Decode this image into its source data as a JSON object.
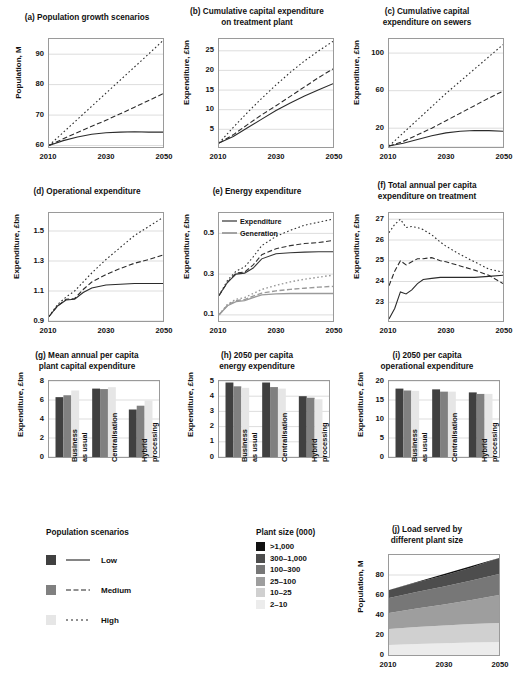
{
  "colors": {
    "low": "#404040",
    "medium": "#808080",
    "high": "#e6e6e6",
    "expenditure": "#333333",
    "generation": "#9a9a9a",
    "axis": "#9a9a9a",
    "grid": "#d9d9d9",
    "plant_sizes": [
      "#111111",
      "#4d4d4d",
      "#777777",
      "#9e9e9e",
      "#d0d0d0",
      "#ececec"
    ]
  },
  "panels": {
    "a": {
      "title": "(a) Population growth scenarios",
      "ylabel": "Population, M",
      "xlabel": "",
      "yticks": [
        "60",
        "70",
        "80",
        "90"
      ],
      "xticks": [
        "2010",
        "2030",
        "2050"
      ]
    },
    "b": {
      "title": "(b) Cumulative capital expenditure\non treatment plant",
      "title_line1": "(b) Cumulative capital expenditure",
      "title_line2": "on treatment plant",
      "ylabel": "Expenditure, £bn",
      "yticks": [
        "5",
        "10",
        "15",
        "20",
        "25"
      ],
      "xticks": [
        "2010",
        "2030",
        "2050"
      ]
    },
    "c": {
      "title_line1": "(c) Cumulative capital",
      "title_line2": "expenditure on sewers",
      "ylabel": "Expenditure, £bn",
      "yticks": [
        "0",
        "20",
        "60",
        "100"
      ],
      "xticks": [
        "2010",
        "2030",
        "2050"
      ]
    },
    "d": {
      "title_line1": "(d) Operational expenditure",
      "title_line2": "",
      "ylabel": "Expenditure, £bn",
      "yticks": [
        "0.9",
        "1.1",
        "1.3",
        "1.5"
      ],
      "xticks": [
        "2010",
        "2030",
        "2050"
      ]
    },
    "e": {
      "title_line1": "(e) Energy expenditure",
      "title_line2": "",
      "ylabel": "Expenditure, £bn",
      "yticks": [
        "0.1",
        "0.3",
        "0.5"
      ],
      "xticks": [
        "2010",
        "2030",
        "2050"
      ],
      "legend": [
        {
          "label": "Expenditure",
          "color": "#333333"
        },
        {
          "label": "Generation",
          "color": "#9a9a9a"
        }
      ]
    },
    "f": {
      "title_line1": "(f) Total annual per capita",
      "title_line2": "expenditure on treatment",
      "ylabel": "Expenditure, £bn",
      "yticks": [
        "23",
        "24",
        "25",
        "26",
        "27"
      ],
      "xticks": [
        "2010",
        "2030",
        "2050"
      ]
    },
    "g": {
      "title_line1": "(g) Mean annual per capita",
      "title_line2": "plant capital expenditure",
      "ylabel": "Expenditure, £bn",
      "yticks": [
        "0",
        "2",
        "4",
        "6",
        "8"
      ],
      "xticks": [
        "Business\nas usual",
        "Centralisation",
        "Hybrid\nprocessing"
      ]
    },
    "h": {
      "title_line1": "(h) 2050 per capita",
      "title_line2": "energy expenditure",
      "ylabel": "Expenditure, £bn",
      "yticks": [
        "0",
        "1",
        "2",
        "3",
        "4",
        "5"
      ],
      "xticks": [
        "Business\nas usual",
        "Centralisation",
        "Hybrid\nprocessing"
      ]
    },
    "i": {
      "title_line1": "(i) 2050 per capita",
      "title_line2": "operational expenditure",
      "ylabel": "Expenditure, £bn",
      "yticks": [
        "0",
        "5",
        "10",
        "15",
        "20"
      ],
      "xticks": [
        "Business\nas usual",
        "Centralisation",
        "Hybrid\nprocessing"
      ]
    },
    "j": {
      "title_line1": "(j) Load served by",
      "title_line2": "different plant size",
      "ylabel": "Population, M",
      "yticks": [
        "0",
        "20",
        "40",
        "60",
        "80"
      ],
      "xticks": [
        "2010",
        "2030",
        "2050"
      ]
    }
  },
  "legends": {
    "population": {
      "title": "Population scenarios",
      "items": [
        {
          "label": "Low",
          "color": "#404040",
          "dash": "solid"
        },
        {
          "label": "Medium",
          "color": "#808080",
          "dash": "dashed"
        },
        {
          "label": "High",
          "color": "#e6e6e6",
          "dash": "dotted"
        }
      ]
    },
    "plant_size": {
      "title": "Plant size (000)",
      "items": [
        {
          "label": ">1,000",
          "color": "#111111"
        },
        {
          "label": "300–1,000",
          "color": "#4d4d4d"
        },
        {
          "label": "100–300",
          "color": "#777777"
        },
        {
          "label": "25–100",
          "color": "#9e9e9e"
        },
        {
          "label": "10–25",
          "color": "#d0d0d0"
        },
        {
          "label": "2–10",
          "color": "#ececec"
        }
      ]
    }
  },
  "chart_data": [
    {
      "id": "a",
      "type": "line",
      "title": "(a) Population growth scenarios",
      "xlabel": "",
      "ylabel": "Population, M",
      "xlim": [
        2010,
        2050
      ],
      "ylim": [
        59.5,
        95
      ],
      "yticks": [
        60,
        70,
        80,
        90
      ],
      "xticks": [
        2010,
        2030,
        2050
      ],
      "grid": true,
      "x": [
        2010,
        2015,
        2020,
        2025,
        2030,
        2035,
        2040,
        2045,
        2050
      ],
      "series": [
        {
          "name": "Low",
          "style": "solid",
          "values": [
            60.0,
            61.6,
            62.8,
            63.7,
            64.2,
            64.4,
            64.5,
            64.4,
            64.4
          ]
        },
        {
          "name": "Medium",
          "style": "dashed",
          "values": [
            60.0,
            62.2,
            64.3,
            66.3,
            68.3,
            70.4,
            72.6,
            74.8,
            77.0
          ]
        },
        {
          "name": "High",
          "style": "dotted",
          "values": [
            60.0,
            64.3,
            68.6,
            72.9,
            77.2,
            81.5,
            85.8,
            90.1,
            94.5
          ]
        }
      ]
    },
    {
      "id": "b",
      "type": "line",
      "title": "(b) Cumulative capital expenditure on treatment plant",
      "ylabel": "Expenditure, £bn",
      "xlim": [
        2010,
        2050
      ],
      "ylim": [
        0.5,
        28
      ],
      "yticks": [
        5,
        10,
        15,
        20,
        25
      ],
      "xticks": [
        2010,
        2030,
        2050
      ],
      "grid": true,
      "x": [
        2010,
        2015,
        2020,
        2025,
        2030,
        2035,
        2040,
        2045,
        2050
      ],
      "series": [
        {
          "name": "Low",
          "style": "solid",
          "values": [
            1.5,
            3.2,
            5.4,
            7.6,
            9.8,
            11.7,
            13.5,
            15.1,
            16.6
          ]
        },
        {
          "name": "Medium",
          "style": "dashed",
          "values": [
            1.5,
            3.6,
            6.2,
            8.7,
            11.0,
            13.4,
            15.8,
            18.2,
            20.4
          ]
        },
        {
          "name": "High",
          "style": "dotted",
          "values": [
            1.5,
            5.5,
            9.3,
            12.9,
            16.3,
            19.5,
            22.4,
            25.0,
            27.4
          ]
        }
      ]
    },
    {
      "id": "c",
      "type": "line",
      "title": "(c) Cumulative capital expenditure on sewers",
      "ylabel": "Expenditure, £bn",
      "xlim": [
        2010,
        2050
      ],
      "ylim": [
        0,
        115
      ],
      "yticks": [
        0,
        20,
        60,
        100
      ],
      "xticks": [
        2010,
        2030,
        2050
      ],
      "grid": true,
      "x": [
        2010,
        2015,
        2020,
        2025,
        2030,
        2035,
        2040,
        2045,
        2050
      ],
      "series": [
        {
          "name": "Low",
          "style": "solid",
          "values": [
            1.0,
            4.0,
            8.0,
            12.0,
            15.0,
            16.8,
            17.5,
            17.4,
            16.8
          ]
        },
        {
          "name": "Medium",
          "style": "dashed",
          "values": [
            1.0,
            6.0,
            13.0,
            20.0,
            28.0,
            36.0,
            44.0,
            52.0,
            59.5
          ]
        },
        {
          "name": "High",
          "style": "dotted",
          "values": [
            1.0,
            15.0,
            29.0,
            43.0,
            57.0,
            70.0,
            83.0,
            96.0,
            109.0
          ]
        }
      ]
    },
    {
      "id": "d",
      "type": "line",
      "title": "(d) Operational expenditure",
      "ylabel": "Expenditure, £bn",
      "xlim": [
        2010,
        2050
      ],
      "ylim": [
        0.9,
        1.62
      ],
      "yticks": [
        0.9,
        1.1,
        1.3,
        1.5
      ],
      "xticks": [
        2010,
        2030,
        2050
      ],
      "grid": true,
      "x": [
        2010,
        2013,
        2016,
        2019,
        2022,
        2025,
        2030,
        2035,
        2040,
        2045,
        2050
      ],
      "series": [
        {
          "name": "Low",
          "style": "solid",
          "values": [
            0.93,
            1.0,
            1.04,
            1.045,
            1.09,
            1.12,
            1.14,
            1.145,
            1.15,
            1.15,
            1.15
          ]
        },
        {
          "name": "Medium",
          "style": "dashed",
          "values": [
            0.93,
            1.0,
            1.045,
            1.05,
            1.11,
            1.16,
            1.21,
            1.25,
            1.285,
            1.31,
            1.34
          ]
        },
        {
          "name": "High",
          "style": "dotted",
          "values": [
            0.93,
            1.01,
            1.06,
            1.1,
            1.16,
            1.22,
            1.31,
            1.39,
            1.47,
            1.53,
            1.59
          ]
        }
      ]
    },
    {
      "id": "e",
      "type": "line",
      "title": "(e) Energy expenditure",
      "ylabel": "Expenditure, £bn",
      "xlim": [
        2010,
        2050
      ],
      "ylim": [
        0.07,
        0.6
      ],
      "yticks": [
        0.1,
        0.3,
        0.5
      ],
      "xticks": [
        2010,
        2030,
        2050
      ],
      "grid": true,
      "legend_position": "upper-left",
      "legend_entries": [
        "Expenditure",
        "Generation"
      ],
      "x": [
        2010,
        2013,
        2016,
        2019,
        2022,
        2025,
        2030,
        2035,
        2040,
        2045,
        2050
      ],
      "series": [
        {
          "name": "Expenditure Low",
          "group": "Expenditure",
          "style": "solid",
          "values": [
            0.195,
            0.26,
            0.3,
            0.305,
            0.33,
            0.375,
            0.4,
            0.405,
            0.408,
            0.41,
            0.41
          ]
        },
        {
          "name": "Expenditure Medium",
          "group": "Expenditure",
          "style": "dashed",
          "values": [
            0.195,
            0.26,
            0.305,
            0.31,
            0.345,
            0.395,
            0.425,
            0.44,
            0.45,
            0.455,
            0.465
          ]
        },
        {
          "name": "Expenditure High",
          "group": "Expenditure",
          "style": "dotted",
          "values": [
            0.195,
            0.27,
            0.315,
            0.335,
            0.385,
            0.44,
            0.485,
            0.515,
            0.54,
            0.555,
            0.57
          ]
        },
        {
          "name": "Generation Low",
          "group": "Generation",
          "style": "solid",
          "values": [
            0.1,
            0.145,
            0.165,
            0.17,
            0.185,
            0.198,
            0.203,
            0.205,
            0.205,
            0.205,
            0.205
          ]
        },
        {
          "name": "Generation Medium",
          "group": "Generation",
          "style": "dashed",
          "values": [
            0.1,
            0.148,
            0.17,
            0.175,
            0.192,
            0.207,
            0.218,
            0.225,
            0.231,
            0.236,
            0.24
          ]
        },
        {
          "name": "Generation High",
          "group": "Generation",
          "style": "dotted",
          "values": [
            0.1,
            0.152,
            0.177,
            0.185,
            0.205,
            0.225,
            0.245,
            0.262,
            0.275,
            0.285,
            0.295
          ]
        }
      ]
    },
    {
      "id": "f",
      "type": "line",
      "title": "(f) Total annual per capita expenditure on treatment",
      "ylabel": "Expenditure, £bn",
      "xlim": [
        2010,
        2050
      ],
      "ylim": [
        22.1,
        27.3
      ],
      "yticks": [
        23,
        24,
        25,
        26,
        27
      ],
      "xticks": [
        2010,
        2030,
        2050
      ],
      "grid": true,
      "x": [
        2010,
        2012,
        2014,
        2016,
        2018,
        2020,
        2022,
        2025,
        2028,
        2030,
        2035,
        2040,
        2045,
        2050
      ],
      "series": [
        {
          "name": "Low",
          "style": "solid",
          "values": [
            22.2,
            22.7,
            23.5,
            23.4,
            23.6,
            23.9,
            24.1,
            24.15,
            24.2,
            24.2,
            24.2,
            24.2,
            24.25,
            24.3
          ]
        },
        {
          "name": "Medium",
          "style": "dashed",
          "values": [
            23.8,
            24.5,
            25.0,
            24.8,
            24.95,
            25.1,
            25.1,
            25.15,
            25.0,
            24.95,
            24.75,
            24.55,
            24.3,
            23.9
          ]
        },
        {
          "name": "High",
          "style": "dotted",
          "values": [
            26.35,
            26.75,
            27.0,
            26.6,
            26.65,
            26.6,
            26.5,
            26.25,
            25.9,
            25.7,
            25.3,
            24.95,
            24.6,
            24.45
          ]
        }
      ]
    },
    {
      "id": "g",
      "type": "bar",
      "title": "(g) Mean annual per capita plant capital expenditure",
      "ylabel": "Expenditure, £bn",
      "categories": [
        "Business as usual",
        "Centralisation",
        "Hybrid processing"
      ],
      "ylim": [
        0,
        8
      ],
      "yticks": [
        0,
        2,
        4,
        6,
        8
      ],
      "series": [
        {
          "name": "Low",
          "values": [
            6.3,
            7.2,
            5.0
          ]
        },
        {
          "name": "Medium",
          "values": [
            6.5,
            7.15,
            5.4
          ]
        },
        {
          "name": "High",
          "values": [
            7.0,
            7.35,
            5.95
          ]
        }
      ]
    },
    {
      "id": "h",
      "type": "bar",
      "title": "(h) 2050 per capita energy expenditure",
      "ylabel": "Expenditure, £bn",
      "categories": [
        "Business as usual",
        "Centralisation",
        "Hybrid processing"
      ],
      "ylim": [
        0,
        5
      ],
      "yticks": [
        0,
        1,
        2,
        3,
        4,
        5
      ],
      "series": [
        {
          "name": "Low",
          "values": [
            4.9,
            4.9,
            4.0
          ]
        },
        {
          "name": "Medium",
          "values": [
            4.65,
            4.6,
            3.9
          ]
        },
        {
          "name": "High",
          "values": [
            4.55,
            4.5,
            3.8
          ]
        }
      ]
    },
    {
      "id": "i",
      "type": "bar",
      "title": "(i) 2050 per capita operational expenditure",
      "ylabel": "Expenditure, £bn",
      "categories": [
        "Business as usual",
        "Centralisation",
        "Hybrid processing"
      ],
      "ylim": [
        0,
        20
      ],
      "yticks": [
        0,
        5,
        10,
        15,
        20
      ],
      "series": [
        {
          "name": "Low",
          "values": [
            18.0,
            17.8,
            17.0
          ]
        },
        {
          "name": "Medium",
          "values": [
            17.5,
            17.2,
            16.6
          ]
        },
        {
          "name": "High",
          "values": [
            17.4,
            17.2,
            16.6
          ]
        }
      ]
    },
    {
      "id": "j",
      "type": "area",
      "title": "(j) Load served by different plant size",
      "ylabel": "Population, M",
      "xlim": [
        2010,
        2050
      ],
      "ylim": [
        0,
        100
      ],
      "yticks": [
        0,
        20,
        40,
        60,
        80
      ],
      "xticks": [
        2010,
        2030,
        2050
      ],
      "stacked": true,
      "x": [
        2010,
        2020,
        2030,
        2040,
        2050
      ],
      "series": [
        {
          "name": "2–10",
          "values": [
            10.0,
            11.0,
            11.8,
            12.5,
            13.0
          ]
        },
        {
          "name": "10–25",
          "values": [
            16.0,
            17.0,
            17.8,
            18.6,
            19.0
          ]
        },
        {
          "name": "25–100",
          "values": [
            16.0,
            18.5,
            21.0,
            24.0,
            28.0
          ]
        },
        {
          "name": "100–300",
          "values": [
            15.0,
            16.5,
            18.0,
            19.5,
            21.0
          ]
        },
        {
          "name": "300–1,000",
          "values": [
            8.0,
            9.5,
            11.0,
            13.0,
            16.0
          ]
        }
      ]
    }
  ]
}
